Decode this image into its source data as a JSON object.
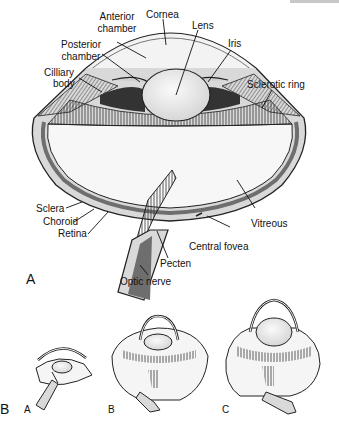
{
  "figure": {
    "part_a_label": "A",
    "part_b_label": "B",
    "labels": {
      "cornea": "Cornea",
      "anterior_chamber_1": "Anterior",
      "anterior_chamber_2": "chamber",
      "lens": "Lens",
      "posterior_chamber_1": "Posterior",
      "posterior_chamber_2": "chamber",
      "iris": "Iris",
      "ciliary_body_1": "Cilliary",
      "ciliary_body_2": "body",
      "sclerotic_ring": "Sclerotic ring",
      "sclera": "Sclera",
      "choroid": "Choroid",
      "retina": "Retina",
      "vitreous": "Vitreous",
      "central_fovea": "Central fovea",
      "pecten": "Pecten",
      "optic_nerve": "Optic nerve"
    },
    "sub_eyes": [
      {
        "label": "A"
      },
      {
        "label": "B"
      },
      {
        "label": "C"
      }
    ],
    "colors": {
      "outline": "#222222",
      "sclera_fill": "#d9d9d9",
      "choroid_fill": "#6e6e6e",
      "lens_fill": "#ebebeb",
      "vitreous_fill": "#f7f7f7",
      "topbar": "#c8c8c8"
    }
  }
}
